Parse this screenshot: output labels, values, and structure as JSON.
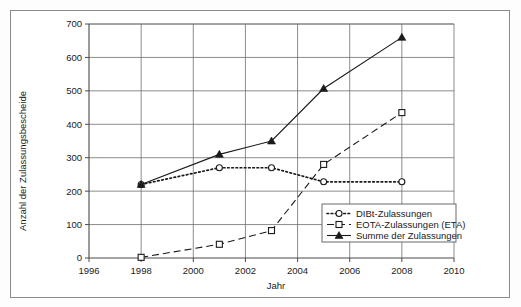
{
  "chart_data": {
    "type": "line",
    "title": "",
    "xlabel": "Jahr",
    "ylabel": "Anzahl der Zulassungsbescheide",
    "xlim": [
      1996,
      2010
    ],
    "ylim": [
      0,
      700
    ],
    "xticks": [
      1996,
      1998,
      2000,
      2002,
      2004,
      2006,
      2008,
      2010
    ],
    "yticks": [
      0,
      100,
      200,
      300,
      400,
      500,
      600,
      700
    ],
    "grid": true,
    "legend_position": "inside-bottom-right",
    "series": [
      {
        "name": "DIBt-Zulassungen",
        "marker": "open-circle",
        "line_style": "dotted",
        "x": [
          1998,
          2001,
          2003,
          2005,
          2008
        ],
        "values": [
          220,
          270,
          270,
          228,
          228
        ]
      },
      {
        "name": "EOTA-Zulassungen (ETA)",
        "marker": "open-square",
        "line_style": "dashed",
        "x": [
          1998,
          2001,
          2003,
          2005,
          2008
        ],
        "values": [
          2,
          41,
          82,
          280,
          435
        ]
      },
      {
        "name": "Summe der Zulassungen",
        "marker": "filled-triangle",
        "line_style": "solid",
        "x": [
          1998,
          2001,
          2003,
          2005,
          2008
        ],
        "values": [
          220,
          310,
          350,
          507,
          660
        ]
      }
    ]
  },
  "colors": {
    "frame": "#8a8a8a",
    "grid": "#6f6f6f",
    "axis": "#4a4a4a",
    "ink": "#1a1a1a",
    "plot_background": "#ffffff"
  },
  "axis": {
    "x_title": "Jahr",
    "y_title": "Anzahl der Zulassungsbescheide",
    "x_tick_labels": [
      "1996",
      "1998",
      "2000",
      "2002",
      "2004",
      "2006",
      "2008",
      "2010"
    ],
    "y_tick_labels": [
      "0",
      "100",
      "200",
      "300",
      "400",
      "500",
      "600",
      "700"
    ]
  },
  "legend": {
    "entries": [
      {
        "label": "DIBt-Zulassungen",
        "marker": "open-circle",
        "line_style": "dotted"
      },
      {
        "label": "EOTA-Zulassungen (ETA)",
        "marker": "open-square",
        "line_style": "dashed"
      },
      {
        "label": "Summe der Zulassungen",
        "marker": "filled-triangle",
        "line_style": "solid"
      }
    ]
  }
}
